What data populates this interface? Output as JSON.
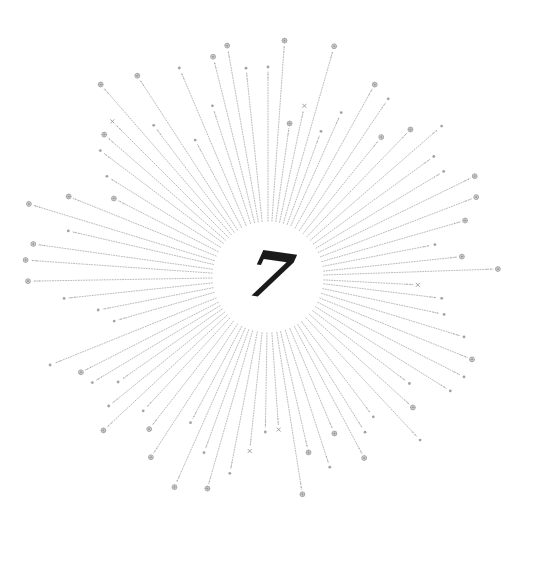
{
  "artwork": {
    "title": "Sunburst with numeral",
    "numeral": "7",
    "colors": {
      "background": "#ffffff",
      "ray": "#9a9a9a",
      "sparkle": "#8c8c8c",
      "numeral": "#1a1a1a"
    },
    "center": {
      "x": 268,
      "y": 277
    },
    "inner_radius": 50,
    "rays": [
      {
        "angle": -90,
        "length": 205,
        "sparkle": "dot"
      },
      {
        "angle": -86,
        "length": 232,
        "sparkle": "star"
      },
      {
        "angle": -82,
        "length": 150,
        "sparkle": "star"
      },
      {
        "angle": -78,
        "length": 170,
        "sparkle": "cross"
      },
      {
        "angle": -96,
        "length": 205,
        "sparkle": "dot"
      },
      {
        "angle": -100,
        "length": 230,
        "sparkle": "star"
      },
      {
        "angle": -104,
        "length": 222,
        "sparkle": "star"
      },
      {
        "angle": -108,
        "length": 175,
        "sparkle": "dot"
      },
      {
        "angle": -113,
        "length": 222,
        "sparkle": "dot"
      },
      {
        "angle": -118,
        "length": 150,
        "sparkle": "dot"
      },
      {
        "angle": -123,
        "length": 235,
        "sparkle": "star"
      },
      {
        "angle": -127,
        "length": 185,
        "sparkle": "dot"
      },
      {
        "angle": -131,
        "length": 250,
        "sparkle": "star"
      },
      {
        "angle": -135,
        "length": 215,
        "sparkle": "cross"
      },
      {
        "angle": -139,
        "length": 212,
        "sparkle": "star"
      },
      {
        "angle": -143,
        "length": 205,
        "sparkle": "dot"
      },
      {
        "angle": -148,
        "length": 185,
        "sparkle": "dot"
      },
      {
        "angle": -153,
        "length": 168,
        "sparkle": "star"
      },
      {
        "angle": -158,
        "length": 210,
        "sparkle": "star"
      },
      {
        "angle": -163,
        "length": 245,
        "sparkle": "star"
      },
      {
        "angle": -167,
        "length": 200,
        "sparkle": "dot"
      },
      {
        "angle": -172,
        "length": 232,
        "sparkle": "star"
      },
      {
        "angle": -176,
        "length": 238,
        "sparkle": "star"
      },
      {
        "angle": 179,
        "length": 235,
        "sparkle": "star"
      },
      {
        "angle": 174,
        "length": 200,
        "sparkle": "dot"
      },
      {
        "angle": 169,
        "length": 168,
        "sparkle": "dot"
      },
      {
        "angle": 164,
        "length": 155,
        "sparkle": "dot"
      },
      {
        "angle": 158,
        "length": 230,
        "sparkle": "dot"
      },
      {
        "angle": 153,
        "length": 205,
        "sparkle": "star"
      },
      {
        "angle": 149,
        "length": 200,
        "sparkle": "dot"
      },
      {
        "angle": 145,
        "length": 178,
        "sparkle": "dot"
      },
      {
        "angle": 141,
        "length": 200,
        "sparkle": "dot"
      },
      {
        "angle": 137,
        "length": 220,
        "sparkle": "star"
      },
      {
        "angle": 133,
        "length": 178,
        "sparkle": "dot"
      },
      {
        "angle": 128,
        "length": 188,
        "sparkle": "star"
      },
      {
        "angle": 123,
        "length": 210,
        "sparkle": "star"
      },
      {
        "angle": 118,
        "length": 160,
        "sparkle": "dot"
      },
      {
        "angle": 114,
        "length": 225,
        "sparkle": "star"
      },
      {
        "angle": 110,
        "length": 182,
        "sparkle": "dot"
      },
      {
        "angle": 106,
        "length": 215,
        "sparkle": "star"
      },
      {
        "angle": 101,
        "length": 195,
        "sparkle": "dot"
      },
      {
        "angle": 96,
        "length": 170,
        "sparkle": "cross"
      },
      {
        "angle": 91,
        "length": 150,
        "sparkle": "dot"
      },
      {
        "angle": 86,
        "length": 148,
        "sparkle": "cross"
      },
      {
        "angle": 81,
        "length": 215,
        "sparkle": "star"
      },
      {
        "angle": 77,
        "length": 175,
        "sparkle": "star"
      },
      {
        "angle": 72,
        "length": 195,
        "sparkle": "dot"
      },
      {
        "angle": 67,
        "length": 165,
        "sparkle": "star"
      },
      {
        "angle": 62,
        "length": 200,
        "sparkle": "star"
      },
      {
        "angle": 58,
        "length": 178,
        "sparkle": "dot"
      },
      {
        "angle": 53,
        "length": 170,
        "sparkle": "dot"
      },
      {
        "angle": 47,
        "length": 218,
        "sparkle": "dot"
      },
      {
        "angle": 42,
        "length": 190,
        "sparkle": "star"
      },
      {
        "angle": 37,
        "length": 172,
        "sparkle": "dot"
      },
      {
        "angle": 32,
        "length": 210,
        "sparkle": "dot"
      },
      {
        "angle": 27,
        "length": 215,
        "sparkle": "dot"
      },
      {
        "angle": 22,
        "length": 215,
        "sparkle": "star"
      },
      {
        "angle": 17,
        "length": 200,
        "sparkle": "dot"
      },
      {
        "angle": 12,
        "length": 175,
        "sparkle": "dot"
      },
      {
        "angle": 7,
        "length": 170,
        "sparkle": "dot"
      },
      {
        "angle": 3,
        "length": 145,
        "sparkle": "cross"
      },
      {
        "angle": -2,
        "length": 225,
        "sparkle": "star"
      },
      {
        "angle": -6,
        "length": 190,
        "sparkle": "star"
      },
      {
        "angle": -11,
        "length": 165,
        "sparkle": "dot"
      },
      {
        "angle": -16,
        "length": 200,
        "sparkle": "star"
      },
      {
        "angle": -21,
        "length": 218,
        "sparkle": "star"
      },
      {
        "angle": -26,
        "length": 225,
        "sparkle": "star"
      },
      {
        "angle": -31,
        "length": 200,
        "sparkle": "dot"
      },
      {
        "angle": -36,
        "length": 200,
        "sparkle": "dot"
      },
      {
        "angle": -41,
        "length": 225,
        "sparkle": "dot"
      },
      {
        "angle": -46,
        "length": 200,
        "sparkle": "star"
      },
      {
        "angle": -51,
        "length": 175,
        "sparkle": "star"
      },
      {
        "angle": -56,
        "length": 210,
        "sparkle": "dot"
      },
      {
        "angle": -61,
        "length": 215,
        "sparkle": "star"
      },
      {
        "angle": -66,
        "length": 175,
        "sparkle": "dot"
      },
      {
        "angle": -70,
        "length": 150,
        "sparkle": "dot"
      },
      {
        "angle": -74,
        "length": 235,
        "sparkle": "star"
      }
    ]
  }
}
